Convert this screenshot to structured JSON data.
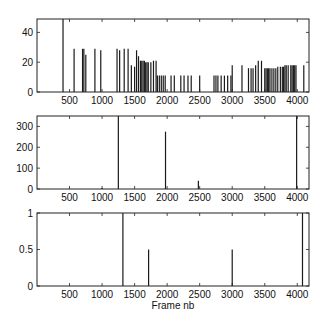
{
  "chart_data": [
    {
      "type": "bar",
      "title": "",
      "xlabel": "",
      "ylabel": "",
      "xlim": [
        0,
        4180
      ],
      "ylim": [
        0,
        49
      ],
      "xticks": [
        500,
        1000,
        1500,
        2000,
        2500,
        3000,
        3500,
        4000
      ],
      "yticks": [
        0,
        20,
        40
      ],
      "grid": false,
      "x": [
        400,
        570,
        700,
        720,
        750,
        890,
        980,
        1230,
        1270,
        1340,
        1400,
        1450,
        1500,
        1530,
        1560,
        1590,
        1610,
        1630,
        1650,
        1670,
        1690,
        1710,
        1750,
        1790,
        1830,
        1850,
        1880,
        1910,
        1940,
        1970,
        2060,
        2110,
        2210,
        2260,
        2320,
        2370,
        2500,
        2720,
        2750,
        2780,
        2830,
        2880,
        2930,
        2980,
        3000,
        3150,
        3250,
        3290,
        3320,
        3360,
        3400,
        3450,
        3500,
        3520,
        3540,
        3560,
        3580,
        3610,
        3640,
        3670,
        3700,
        3740,
        3770,
        3790,
        3810,
        3830,
        3860,
        3900,
        3920,
        3940,
        3960,
        3980,
        4100
      ],
      "values": [
        49,
        29,
        29,
        29,
        25,
        29,
        28,
        29,
        28,
        29,
        29,
        18,
        17,
        28,
        24,
        21,
        21,
        21,
        21,
        20,
        20,
        20,
        20,
        21,
        21,
        11,
        11,
        11,
        11,
        11,
        11,
        11,
        11,
        11,
        11,
        11,
        11,
        11,
        11,
        11,
        11,
        11,
        11,
        11,
        18,
        18,
        16,
        16,
        16,
        18,
        21,
        21,
        16,
        16,
        16,
        16,
        16,
        16,
        16,
        16,
        17,
        17,
        17,
        17,
        18,
        18,
        18,
        18,
        18,
        18,
        18,
        18,
        18
      ]
    },
    {
      "type": "bar",
      "title": "",
      "xlabel": "",
      "ylabel": "",
      "xlim": [
        0,
        4180
      ],
      "ylim": [
        0,
        350
      ],
      "xticks": [
        500,
        1000,
        1500,
        2000,
        2500,
        3000,
        3500,
        4000
      ],
      "yticks": [
        0,
        100,
        200,
        300
      ],
      "grid": false,
      "x": [
        1000,
        1250,
        1975,
        2480,
        3990
      ],
      "values": [
        5,
        350,
        275,
        40,
        350
      ]
    },
    {
      "type": "bar",
      "title": "",
      "xlabel": "Frame nb",
      "ylabel": "",
      "xlim": [
        0,
        4180
      ],
      "ylim": [
        0,
        1
      ],
      "xticks": [
        500,
        1000,
        1500,
        2000,
        2500,
        3000,
        3500,
        4000
      ],
      "yticks": [
        0,
        0.5,
        1
      ],
      "grid": false,
      "x": [
        1320,
        1715,
        3000,
        4080
      ],
      "values": [
        1,
        0.5,
        0.5,
        1
      ]
    }
  ],
  "colors": {
    "bars": "#1a1a1a",
    "axes": "#222222",
    "background": "#ffffff"
  }
}
